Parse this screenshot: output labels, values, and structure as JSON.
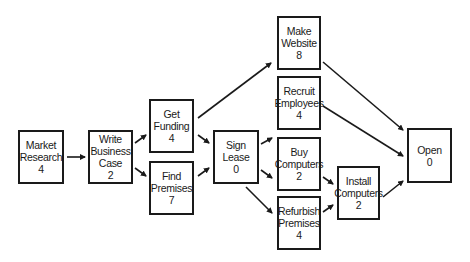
{
  "diagram": {
    "nodes": [
      {
        "id": "market_research",
        "lines": [
          "Market",
          "Research",
          "4"
        ],
        "duration": 4,
        "x": 18,
        "y": 130,
        "w": 46,
        "h": 54
      },
      {
        "id": "write_business_case",
        "lines": [
          "Write",
          "Business",
          "Case",
          "2"
        ],
        "duration": 2,
        "x": 88,
        "y": 130,
        "w": 45,
        "h": 54
      },
      {
        "id": "get_funding",
        "lines": [
          "Get",
          "Funding",
          "4"
        ],
        "duration": 4,
        "x": 149,
        "y": 99,
        "w": 45,
        "h": 54
      },
      {
        "id": "find_premises",
        "lines": [
          "Find",
          "Premises",
          "7"
        ],
        "duration": 7,
        "x": 149,
        "y": 161,
        "w": 45,
        "h": 54
      },
      {
        "id": "sign_lease",
        "lines": [
          "Sign",
          "Lease",
          "0"
        ],
        "duration": 0,
        "x": 213,
        "y": 130,
        "w": 46,
        "h": 54
      },
      {
        "id": "make_website",
        "lines": [
          "Make",
          "Website",
          "8"
        ],
        "duration": 8,
        "x": 277,
        "y": 16,
        "w": 44,
        "h": 54
      },
      {
        "id": "recruit_employees",
        "lines": [
          "Recruit",
          "Employees",
          "4"
        ],
        "duration": 4,
        "x": 277,
        "y": 76,
        "w": 44,
        "h": 54
      },
      {
        "id": "buy_computers",
        "lines": [
          "Buy",
          "Computers",
          "2"
        ],
        "duration": 2,
        "x": 277,
        "y": 137,
        "w": 44,
        "h": 54
      },
      {
        "id": "refurbish_premises",
        "lines": [
          "Refurbish",
          "Premises",
          "4"
        ],
        "duration": 4,
        "x": 277,
        "y": 196,
        "w": 44,
        "h": 54
      },
      {
        "id": "install_computers",
        "lines": [
          "Install",
          "Computers",
          "2"
        ],
        "duration": 2,
        "x": 337,
        "y": 166,
        "w": 43,
        "h": 54
      },
      {
        "id": "open",
        "lines": [
          "Open",
          "0"
        ],
        "duration": 0,
        "x": 407,
        "y": 128,
        "w": 45,
        "h": 55
      }
    ],
    "edges": [
      {
        "from": "market_research",
        "to": "write_business_case",
        "x1": 67,
        "y1": 157,
        "x2": 85,
        "y2": 157
      },
      {
        "from": "write_business_case",
        "to": "get_funding",
        "x1": 135,
        "y1": 143,
        "x2": 146,
        "y2": 135
      },
      {
        "from": "write_business_case",
        "to": "find_premises",
        "x1": 135,
        "y1": 168,
        "x2": 146,
        "y2": 176
      },
      {
        "from": "get_funding",
        "to": "make_website",
        "x1": 198,
        "y1": 118,
        "x2": 271,
        "y2": 63
      },
      {
        "from": "get_funding",
        "to": "sign_lease",
        "x1": 198,
        "y1": 135,
        "x2": 209,
        "y2": 143
      },
      {
        "from": "find_premises",
        "to": "sign_lease",
        "x1": 198,
        "y1": 176,
        "x2": 209,
        "y2": 168
      },
      {
        "from": "sign_lease",
        "to": "recruit_employees",
        "x1": 261,
        "y1": 144,
        "x2": 272,
        "y2": 138
      },
      {
        "from": "sign_lease",
        "to": "buy_computers",
        "x1": 261,
        "y1": 170,
        "x2": 272,
        "y2": 178
      },
      {
        "from": "sign_lease",
        "to": "refurbish_premises",
        "x1": 246,
        "y1": 187,
        "x2": 272,
        "y2": 213
      },
      {
        "from": "buy_computers",
        "to": "install_computers",
        "x1": 323,
        "y1": 177,
        "x2": 333,
        "y2": 184
      },
      {
        "from": "refurbish_premises",
        "to": "install_computers",
        "x1": 323,
        "y1": 212,
        "x2": 333,
        "y2": 205
      },
      {
        "from": "make_website",
        "to": "open",
        "x1": 323,
        "y1": 62,
        "x2": 403,
        "y2": 130
      },
      {
        "from": "recruit_employees",
        "to": "open",
        "x1": 323,
        "y1": 106,
        "x2": 403,
        "y2": 156
      },
      {
        "from": "install_computers",
        "to": "open",
        "x1": 383,
        "y1": 197,
        "x2": 403,
        "y2": 181
      }
    ]
  }
}
